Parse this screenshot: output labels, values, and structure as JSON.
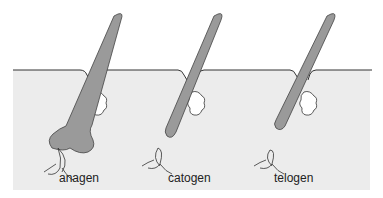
{
  "diagram": {
    "colors": {
      "skin": "#ececec",
      "hair": "#9a9a9a",
      "outline": "#333333",
      "gland": "#ffffff",
      "background": "#ffffff"
    },
    "stages": [
      {
        "label": "anagen"
      },
      {
        "label": "catogen"
      },
      {
        "label": "telogen"
      }
    ]
  }
}
